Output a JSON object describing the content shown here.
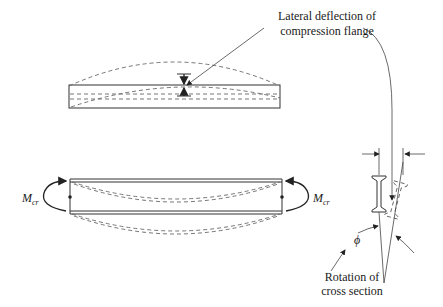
{
  "diagram": {
    "labels": {
      "lateral_deflection_line1": "Lateral deflection of",
      "lateral_deflection_line2": "compression flange",
      "moment_symbol": "M",
      "moment_subscript": "cr",
      "rotation_line1": "Rotation of",
      "rotation_line2": "cross section",
      "angle_symbol": "ϕ"
    },
    "elements": [
      {
        "id": "plan-view-beam",
        "description": "Top view of beam with dashed deflected compression flange shape"
      },
      {
        "id": "elevation-view-beam",
        "description": "Side view of beam under end moments Mcr with dashed buckled shape"
      },
      {
        "id": "cross-section",
        "description": "I-section showing original (solid) and rotated (dashed) positions with rotation angle ϕ"
      }
    ]
  }
}
